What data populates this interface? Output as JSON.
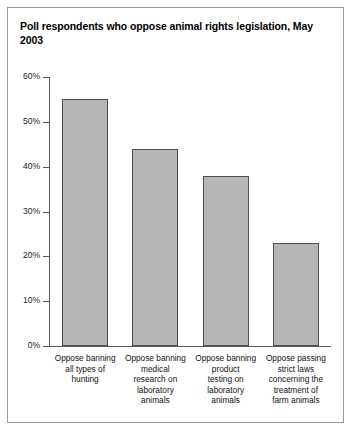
{
  "chart_data": {
    "type": "bar",
    "title": "Poll respondents who oppose animal rights legislation, May 2003",
    "xlabel": "",
    "ylabel": "",
    "ylim": [
      0,
      60
    ],
    "y_unit": "%",
    "grid": false,
    "legend": "none",
    "y_ticks": [
      "0%",
      "10%",
      "20%",
      "30%",
      "40%",
      "50%",
      "60%"
    ],
    "y_tick_values": [
      0,
      10,
      20,
      30,
      40,
      50,
      60
    ],
    "categories": [
      "Oppose banning all types of hunting",
      "Oppose banning medical research on laboratory animals",
      "Oppose banning product testing on laboratory animals",
      "Oppose passing strict laws concerning the treatment of farm animals"
    ],
    "category_lines": [
      [
        "Oppose banning",
        "all types of",
        "hunting"
      ],
      [
        "Oppose banning",
        "medical",
        "research on",
        "laboratory",
        "animals"
      ],
      [
        "Oppose banning",
        "product",
        "testing on",
        "laboratory",
        "animals"
      ],
      [
        "Oppose passing",
        "strict laws",
        "concerning the",
        "treatment of",
        "farm animals"
      ]
    ],
    "values": [
      55,
      44,
      38,
      23
    ],
    "bar_color": "#b6b6b6",
    "bar_border_color": "#4e4e4e",
    "axis_color": "#5a5a5a"
  }
}
